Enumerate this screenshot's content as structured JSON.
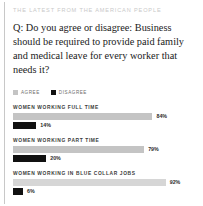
{
  "kicker": "THE LATEST FROM THE AMERICAN PEOPLE",
  "question": "Q: Do you agree or disagree: Business should be required to provide paid family and medical leave for every worker that needs it?",
  "legend": {
    "agree": "AGREE",
    "disagree": "DISAGREE"
  },
  "colors": {
    "agree": "#c4c4c4",
    "disagree": "#111111",
    "rule": "#c8c8c8",
    "kicker": "#c9c9c9",
    "background": "#ffffff"
  },
  "groups": [
    {
      "title": "WOMEN WORKING FULL TIME",
      "agree_label": "84%",
      "agree_value": 84,
      "disagree_label": "14%",
      "disagree_value": 14
    },
    {
      "title": "WOMEN WORKING PART TIME",
      "agree_label": "79%",
      "agree_value": 79,
      "disagree_label": "20%",
      "disagree_value": 20
    },
    {
      "title": "WOMEN WORKING IN BLUE COLLAR JOBS",
      "agree_label": "92%",
      "agree_value": 92,
      "disagree_label": "6%",
      "disagree_value": 6
    }
  ],
  "chart_data": {
    "type": "bar",
    "title": "Q: Do you agree or disagree: Business should be required to provide paid family and medical leave for every worker that needs it?",
    "subtitle": "THE LATEST FROM THE AMERICAN PEOPLE",
    "orientation": "horizontal",
    "categories": [
      "WOMEN WORKING FULL TIME",
      "WOMEN WORKING PART TIME",
      "WOMEN WORKING IN BLUE COLLAR JOBS"
    ],
    "series": [
      {
        "name": "AGREE",
        "values": [
          84,
          79,
          92
        ],
        "color": "#c4c4c4"
      },
      {
        "name": "DISAGREE",
        "values": [
          14,
          20,
          6
        ],
        "color": "#111111"
      }
    ],
    "value_labels": [
      [
        "84%",
        "14%"
      ],
      [
        "79%",
        "20%"
      ],
      [
        "92%",
        "6%"
      ]
    ],
    "xlabel": "",
    "ylabel": "",
    "xlim": [
      0,
      100
    ],
    "unit": "percent",
    "grid": false,
    "legend_position": "top-left"
  }
}
